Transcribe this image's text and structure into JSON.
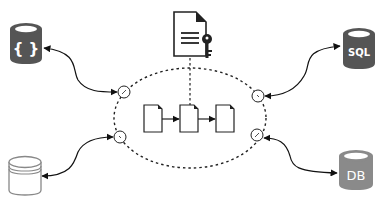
{
  "diagram": {
    "title": "",
    "central_container": {
      "shape": "dashed-ellipse",
      "documents": [
        {
          "id": "doc-1"
        },
        {
          "id": "doc-2"
        },
        {
          "id": "doc-3"
        }
      ],
      "flow": [
        "doc-1 -> doc-2",
        "doc-2 -> doc-3"
      ],
      "ports": [
        "top-left",
        "bottom-left",
        "top-right",
        "bottom-right"
      ]
    },
    "key_document": {
      "icon": "document-with-key-icon",
      "connects_to": "doc-2",
      "line_style": "dashed"
    },
    "data_sources": [
      {
        "position": "top-left",
        "icon": "json-database-icon",
        "label": "{ }",
        "color": "#555555",
        "port": "top-left",
        "arrow": "bidirectional"
      },
      {
        "position": "top-right",
        "icon": "sql-database-icon",
        "label": "SQL",
        "color": "#555555",
        "port": "top-right",
        "arrow": "bidirectional"
      },
      {
        "position": "bottom-left",
        "icon": "plain-database-icon",
        "label": "",
        "color": "#ffffff",
        "port": "bottom-left",
        "arrow": "bidirectional"
      },
      {
        "position": "bottom-right",
        "icon": "db-database-icon",
        "label": "DB",
        "color": "#8a8a8a",
        "port": "bottom-right",
        "arrow": "bidirectional"
      }
    ]
  }
}
